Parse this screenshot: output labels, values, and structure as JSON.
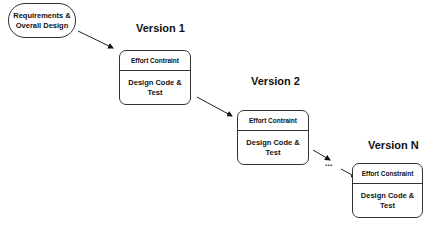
{
  "diagram": {
    "start_node": {
      "label_line1": "Requirements &",
      "label_line2": "Overall Design"
    },
    "versions": [
      {
        "title": "Version 1",
        "constraint": "Effort Contraint",
        "activity_line1": "Design Code &",
        "activity_line2": "Test"
      },
      {
        "title": "Version 2",
        "constraint": "Effort Contraint",
        "activity_line1": "Design Code &",
        "activity_line2": "Test"
      },
      {
        "title": "Version N",
        "constraint": "Effort Constraint",
        "activity_line1": "Design Code &",
        "activity_line2": "Test"
      }
    ],
    "ellipsis": "..."
  }
}
